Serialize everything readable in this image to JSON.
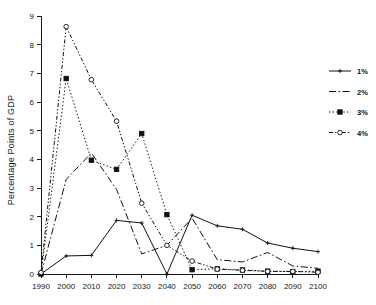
{
  "chart_data": {
    "type": "line",
    "title": "",
    "xlabel": "",
    "ylabel": "Percentage Points of GDP",
    "categories": [
      "1990",
      "2000",
      "2010",
      "2020",
      "2030",
      "2040",
      "2050",
      "2060",
      "2070",
      "2080",
      "2090",
      "2100"
    ],
    "x": [
      1990,
      2000,
      2010,
      2020,
      2030,
      2040,
      2050,
      2060,
      2070,
      2080,
      2090,
      2100
    ],
    "xlim": [
      1990,
      2100
    ],
    "ylim": [
      0,
      9
    ],
    "yticks": [
      0,
      1,
      2,
      3,
      4,
      5,
      6,
      7,
      8,
      9
    ],
    "ytick_labels": [
      "0",
      "1",
      "2",
      "3",
      "4",
      "5",
      "6",
      "7",
      "8",
      "9"
    ],
    "grid": false,
    "legend_position": "right",
    "series": [
      {
        "name": "1%",
        "marker": "plus",
        "linestyle": "solid",
        "values": [
          0.0,
          0.63,
          0.65,
          1.87,
          1.78,
          0.0,
          2.05,
          1.68,
          1.56,
          1.08,
          0.9,
          0.78
        ]
      },
      {
        "name": "2%",
        "marker": "none",
        "linestyle": "dashdot",
        "values": [
          0.0,
          3.3,
          4.22,
          2.95,
          0.7,
          1.0,
          1.95,
          0.5,
          0.42,
          0.75,
          0.28,
          0.2
        ]
      },
      {
        "name": "3%",
        "marker": "square",
        "linestyle": "dotted",
        "values": [
          0.0,
          6.82,
          3.97,
          3.65,
          4.9,
          2.07,
          0.15,
          0.18,
          0.14,
          0.1,
          0.08,
          0.1
        ]
      },
      {
        "name": "4%",
        "marker": "circle",
        "linestyle": "dashdotdot",
        "values": [
          0.05,
          8.63,
          6.78,
          5.33,
          2.47,
          1.0,
          0.45,
          0.17,
          0.13,
          0.09,
          0.09,
          0.06
        ]
      }
    ]
  },
  "legend": {
    "entries": [
      {
        "label": "1%"
      },
      {
        "label": "2%"
      },
      {
        "label": "3%"
      },
      {
        "label": "4%"
      }
    ]
  },
  "axes": {
    "y_title": "Percentage Points of GDP"
  },
  "colors": {
    "ink": "#111111",
    "background": "#ffffff"
  }
}
